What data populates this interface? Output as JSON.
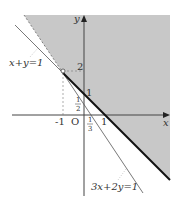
{
  "diagram": {
    "type": "linear-inequality-region",
    "axes": {
      "x_label": "x",
      "y_label": "y",
      "origin_label": "O"
    },
    "tick_labels": {
      "x_neg1": "-1",
      "x_1": "1",
      "x_third_num": "1",
      "x_third_den": "3",
      "y_1": "1",
      "y_2": "2",
      "y_half_num": "1",
      "y_half_den": "2"
    },
    "lines": [
      {
        "label": "x+y=1"
      },
      {
        "label": "3x+2y=1"
      }
    ],
    "point": {
      "x": -1,
      "y": 2
    },
    "colors": {
      "region": "#c8c8c8",
      "boundary": "#111111",
      "line": "#555555"
    }
  }
}
